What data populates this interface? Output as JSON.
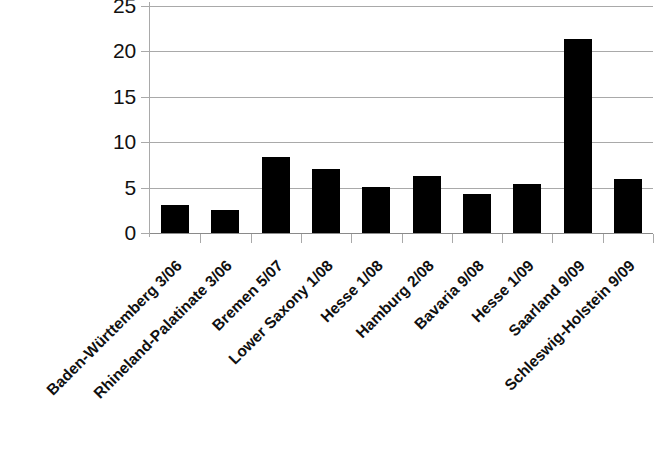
{
  "chart_data": {
    "type": "bar",
    "title": "",
    "subtitle": "",
    "xlabel": "",
    "ylabel": "",
    "ylim": [
      0,
      25
    ],
    "y_ticks": [
      0,
      5,
      10,
      15,
      20,
      25
    ],
    "y_tick_labels": [
      "0",
      "5",
      "10",
      "15",
      "20",
      "25"
    ],
    "grid": true,
    "grid_axis": "y",
    "legend": false,
    "legend_position": "none",
    "bar_color": "#000000",
    "gridline_color": "#a9a9a9",
    "categories": [
      "Baden-Württemberg 3/06",
      "Rhineland-Palatinate 3/06",
      "Bremen 5/07",
      "Lower Saxony 1/08",
      "Hesse 1/08",
      "Hamburg 2/08",
      "Bavaria 9/08",
      "Hesse 1/09",
      "Saarland 9/09",
      "Schleswig-Holstein 9/09"
    ],
    "values": [
      3.1,
      2.5,
      8.4,
      7.1,
      5.1,
      6.3,
      4.3,
      5.4,
      21.4,
      5.9
    ],
    "label_rotation": -45
  }
}
